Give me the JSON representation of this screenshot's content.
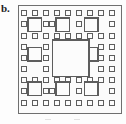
{
  "panel": {
    "label": "b.",
    "caption_alt": "Sierpinski carpet fractal, iteration 3",
    "background_color": "#fdfdfd"
  },
  "frame": {
    "name": "outer-frame",
    "x": 18.5,
    "y": 5.5,
    "width": 103,
    "height": 108,
    "stroke": "#6f6f6f",
    "stroke_width": 1.2,
    "fill": "#fbfbfb"
  },
  "style": {
    "square_stroke": "#5d5d5d",
    "square_fill": "#fcfcfc",
    "small_stroke_width": 1,
    "medium_stroke_width": 1.1,
    "large_stroke_width": 1.2
  },
  "chart_data": {
    "type": "diagram",
    "grid": {
      "cols": 9,
      "rows": 9,
      "cell_w": 11.2,
      "cell_h": 11.7,
      "origin_x": 19.5,
      "origin_y": 6.5
    },
    "counts": {
      "large": 1,
      "medium": 8,
      "small": 56,
      "total": 65
    },
    "large_squares": [
      {
        "x": 52.5,
        "y": 40.0,
        "size": 36.5
      }
    ],
    "medium_squares": [
      {
        "x": 28.0,
        "y": 18.0,
        "size": 13.5
      },
      {
        "x": 56.0,
        "y": 18.0,
        "size": 13.5
      },
      {
        "x": 84.5,
        "y": 18.0,
        "size": 13.5
      },
      {
        "x": 28.0,
        "y": 47.5,
        "size": 13.5
      },
      {
        "x": 84.5,
        "y": 47.5,
        "size": 13.5
      },
      {
        "x": 28.0,
        "y": 82.0,
        "size": 13.5
      },
      {
        "x": 56.0,
        "y": 82.0,
        "size": 13.5
      },
      {
        "x": 84.5,
        "y": 82.0,
        "size": 13.5
      }
    ],
    "small_squares": [
      {
        "x": 21.5,
        "y": 10.0
      },
      {
        "x": 32.0,
        "y": 10.0
      },
      {
        "x": 43.0,
        "y": 10.0
      },
      {
        "x": 54.0,
        "y": 10.0
      },
      {
        "x": 65.0,
        "y": 10.0
      },
      {
        "x": 76.0,
        "y": 10.0
      },
      {
        "x": 87.0,
        "y": 10.0
      },
      {
        "x": 98.0,
        "y": 10.0
      },
      {
        "x": 109.5,
        "y": 10.0
      },
      {
        "x": 21.5,
        "y": 21.5
      },
      {
        "x": 43.0,
        "y": 21.5
      },
      {
        "x": 49.5,
        "y": 21.5
      },
      {
        "x": 76.0,
        "y": 21.5
      },
      {
        "x": 109.5,
        "y": 21.5
      },
      {
        "x": 21.5,
        "y": 33.0
      },
      {
        "x": 32.0,
        "y": 33.0
      },
      {
        "x": 43.0,
        "y": 33.0
      },
      {
        "x": 54.0,
        "y": 33.0
      },
      {
        "x": 65.0,
        "y": 33.0
      },
      {
        "x": 76.0,
        "y": 33.0
      },
      {
        "x": 87.0,
        "y": 33.0
      },
      {
        "x": 98.0,
        "y": 33.0
      },
      {
        "x": 109.5,
        "y": 33.0
      },
      {
        "x": 21.5,
        "y": 44.0
      },
      {
        "x": 43.0,
        "y": 44.0
      },
      {
        "x": 98.0,
        "y": 44.0
      },
      {
        "x": 109.5,
        "y": 44.0
      },
      {
        "x": 21.5,
        "y": 55.0
      },
      {
        "x": 43.0,
        "y": 55.0
      },
      {
        "x": 98.0,
        "y": 55.0
      },
      {
        "x": 109.5,
        "y": 55.0
      },
      {
        "x": 21.5,
        "y": 66.0
      },
      {
        "x": 43.0,
        "y": 66.0
      },
      {
        "x": 98.0,
        "y": 66.0
      },
      {
        "x": 109.5,
        "y": 66.0
      },
      {
        "x": 21.5,
        "y": 77.0
      },
      {
        "x": 32.0,
        "y": 77.0
      },
      {
        "x": 43.0,
        "y": 77.0
      },
      {
        "x": 54.0,
        "y": 77.0
      },
      {
        "x": 65.0,
        "y": 77.0
      },
      {
        "x": 76.0,
        "y": 77.0
      },
      {
        "x": 87.0,
        "y": 77.0
      },
      {
        "x": 98.0,
        "y": 77.0
      },
      {
        "x": 109.5,
        "y": 77.0
      },
      {
        "x": 21.5,
        "y": 88.5
      },
      {
        "x": 43.0,
        "y": 88.5
      },
      {
        "x": 49.5,
        "y": 88.5
      },
      {
        "x": 76.0,
        "y": 88.5
      },
      {
        "x": 109.5,
        "y": 88.5
      },
      {
        "x": 21.5,
        "y": 100.5
      },
      {
        "x": 32.0,
        "y": 100.5
      },
      {
        "x": 43.0,
        "y": 100.5
      },
      {
        "x": 54.0,
        "y": 100.5
      },
      {
        "x": 65.0,
        "y": 100.5
      },
      {
        "x": 76.0,
        "y": 100.5
      },
      {
        "x": 87.0,
        "y": 100.5
      },
      {
        "x": 98.0,
        "y": 100.5
      },
      {
        "x": 109.5,
        "y": 100.5
      }
    ],
    "small_size": 5.2
  }
}
